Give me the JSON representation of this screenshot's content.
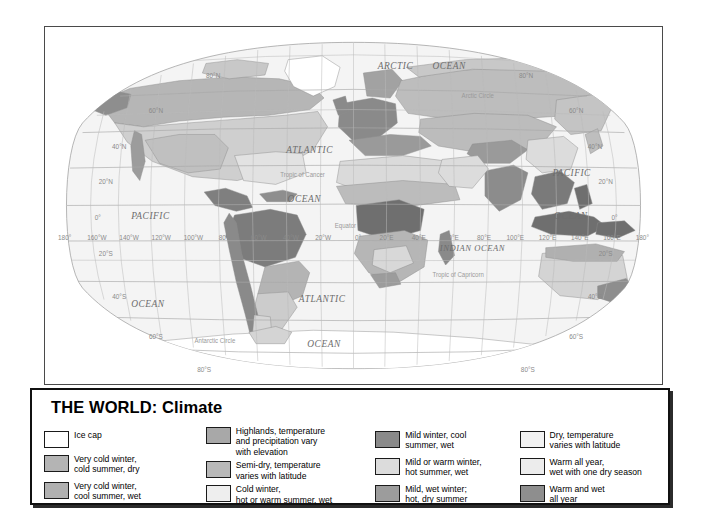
{
  "legend": {
    "title": "THE WORLD: Climate",
    "columns": [
      {
        "id": "column-1",
        "entries": [
          {
            "label": "Ice cap",
            "color": "#ffffff"
          },
          {
            "label": "Very cold winter,\ncold summer, dry",
            "color": "#b4b4b4"
          },
          {
            "label": "Very cold winter,\ncool summer, wet",
            "color": "#b0b0b0"
          }
        ]
      },
      {
        "id": "column-2",
        "entries": [
          {
            "label": "Highlands, temperature\nand precipitation vary\nwith elevation",
            "color": "#a8a8a8"
          },
          {
            "label": "Semi-dry, temperature\nvaries with latitude",
            "color": "#b8b8b8"
          },
          {
            "label": "Cold winter,\nhot or warm summer, wet",
            "color": "#eeeeee"
          }
        ]
      },
      {
        "id": "column-3",
        "entries": [
          {
            "label": "Mild winter, cool\nsummer, wet",
            "color": "#8a8a8a"
          },
          {
            "label": "Mild or warm winter,\nhot summer, wet",
            "color": "#dcdcdc"
          },
          {
            "label": "Mild, wet winter;\nhot, dry summer",
            "color": "#9c9c9c"
          }
        ]
      },
      {
        "id": "column-4",
        "entries": [
          {
            "label": "Dry, temperature\nvaries with latitude",
            "color": "#f2f2f2"
          },
          {
            "label": "Warm all year,\nwet with one dry season",
            "color": "#ececec"
          },
          {
            "label": "Warm and wet\nall year",
            "color": "#8e8e8e"
          }
        ]
      }
    ]
  },
  "map": {
    "ocean_labels": [
      {
        "text": "ARCTIC",
        "x": 392,
        "y": 44
      },
      {
        "text": "OCEAN",
        "x": 452,
        "y": 44
      },
      {
        "text": "ATLANTIC",
        "x": 296,
        "y": 131
      },
      {
        "text": "OCEAN",
        "x": 290,
        "y": 182
      },
      {
        "text": "PACIFIC",
        "x": 118,
        "y": 200
      },
      {
        "text": "OCEAN",
        "x": 115,
        "y": 292
      },
      {
        "text": "ATLANTIC",
        "x": 310,
        "y": 287
      },
      {
        "text": "OCEAN",
        "x": 312,
        "y": 333
      },
      {
        "text": "INDIAN OCEAN",
        "x": 478,
        "y": 233
      },
      {
        "text": "PACIFIC",
        "x": 589,
        "y": 155
      },
      {
        "text": "OCEAN",
        "x": 588,
        "y": 200
      }
    ],
    "reference_lines": [
      {
        "text": "Arctic Circle",
        "x": 484,
        "y": 74
      },
      {
        "text": "Tropic of Cancer",
        "x": 288,
        "y": 156
      },
      {
        "text": "Equator",
        "x": 336,
        "y": 209
      },
      {
        "text": "Tropic of Capricorn",
        "x": 462,
        "y": 260
      },
      {
        "text": "Antarctic Circle",
        "x": 190,
        "y": 329
      }
    ],
    "latitude_labels_left": [
      {
        "text": "80°N",
        "x": 188,
        "y": 53
      },
      {
        "text": "60°N",
        "x": 124,
        "y": 90
      },
      {
        "text": "40°N",
        "x": 83,
        "y": 127
      },
      {
        "text": "20°N",
        "x": 68,
        "y": 164
      },
      {
        "text": "0°",
        "x": 59,
        "y": 201
      },
      {
        "text": "20°S",
        "x": 68,
        "y": 239
      },
      {
        "text": "40°S",
        "x": 83,
        "y": 283
      },
      {
        "text": "60°S",
        "x": 124,
        "y": 325
      },
      {
        "text": "80°S",
        "x": 178,
        "y": 360
      }
    ],
    "latitude_labels_right": [
      {
        "text": "80°N",
        "x": 538,
        "y": 53
      },
      {
        "text": "60°N",
        "x": 594,
        "y": 90
      },
      {
        "text": "40°N",
        "x": 615,
        "y": 127
      },
      {
        "text": "20°N",
        "x": 627,
        "y": 164
      },
      {
        "text": "0°",
        "x": 637,
        "y": 201
      },
      {
        "text": "20°S",
        "x": 627,
        "y": 239
      },
      {
        "text": "40°S",
        "x": 615,
        "y": 283
      },
      {
        "text": "60°S",
        "x": 594,
        "y": 325
      },
      {
        "text": "80°S",
        "x": 540,
        "y": 360
      }
    ],
    "longitude_labels": [
      {
        "text": "180°",
        "x": 22
      },
      {
        "text": "160°W",
        "x": 58
      },
      {
        "text": "140°W",
        "x": 94
      },
      {
        "text": "120°W",
        "x": 130
      },
      {
        "text": "100°W",
        "x": 166
      },
      {
        "text": "80°W",
        "x": 203
      },
      {
        "text": "60°W",
        "x": 239
      },
      {
        "text": "40°W",
        "x": 275
      },
      {
        "text": "20°W",
        "x": 311
      },
      {
        "text": "0°",
        "x": 350
      },
      {
        "text": "20°E",
        "x": 382
      },
      {
        "text": "40°E",
        "x": 418
      },
      {
        "text": "60°E",
        "x": 455
      },
      {
        "text": "80°E",
        "x": 491
      },
      {
        "text": "100°E",
        "x": 526
      },
      {
        "text": "120°E",
        "x": 562
      },
      {
        "text": "140°E",
        "x": 598
      },
      {
        "text": "160°E",
        "x": 634
      },
      {
        "text": "180°",
        "x": 668
      }
    ],
    "longitude_label_y": 222
  }
}
